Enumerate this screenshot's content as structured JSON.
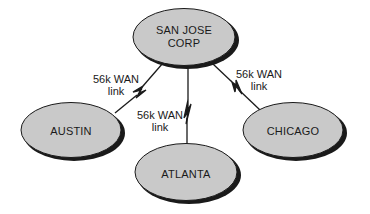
{
  "diagram": {
    "type": "wan-topology",
    "hub": {
      "label_line1": "SAN JOSE",
      "label_line2": "CORP"
    },
    "sites": [
      {
        "label": "AUSTIN"
      },
      {
        "label": "ATLANTA"
      },
      {
        "label": "CHICAGO"
      }
    ],
    "links": [
      {
        "from": "SAN JOSE CORP",
        "to": "AUSTIN",
        "label_line1": "56k WAN",
        "label_line2": "link"
      },
      {
        "from": "SAN JOSE CORP",
        "to": "ATLANTA",
        "label_line1": "56k WAN",
        "label_line2": "link"
      },
      {
        "from": "SAN JOSE CORP",
        "to": "CHICAGO",
        "label_line1": "56k WAN",
        "label_line2": "link"
      }
    ],
    "colors": {
      "node_fill": "#c9c9c9",
      "node_shadow": "#1a1a1a",
      "line": "#1a1a1a",
      "background": "#ffffff"
    }
  }
}
